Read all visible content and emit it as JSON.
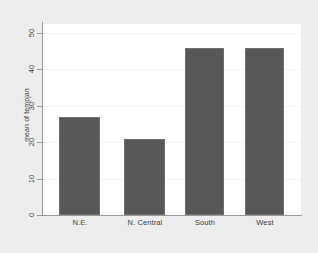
{
  "chart_data": {
    "type": "bar",
    "title": "",
    "subtitle": "",
    "xlabel": "",
    "ylabel": "mean of tempjan",
    "categories": [
      "N.E.",
      "N. Central",
      "South",
      "West"
    ],
    "values": [
      27,
      21,
      46,
      46
    ],
    "ylim": [
      0,
      50
    ],
    "yticks": [
      0,
      10,
      20,
      30,
      40,
      50
    ],
    "ytick_labels": [
      "0",
      "10",
      "20",
      "30",
      "40",
      "50"
    ],
    "grid": true,
    "legend": null,
    "series": [
      {
        "name": "mean of tempjan",
        "values": [
          27,
          21,
          46,
          46
        ]
      }
    ],
    "colors": {
      "bar_fill": "#585858",
      "bar_edge": "#6e6e6e",
      "plot_background": "#ffffff",
      "figure_background": "#ededed",
      "axis_line": "#9a9a9a",
      "gridline": "#f4f4f4",
      "text": "#3d3d3d"
    }
  }
}
